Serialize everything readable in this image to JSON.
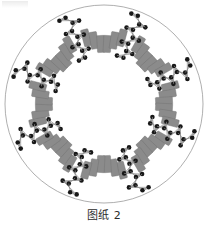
{
  "figure": {
    "caption": "图纸 2",
    "title_text": "图纸 2",
    "type": "radial-winding-diagram",
    "background_color": "#ffffff",
    "outline_color": "#9a9a9a",
    "outline_stroke_width": 0.8,
    "center": {
      "x": 104,
      "y": 104
    },
    "outer_radius": 99,
    "inner_radius": 40,
    "sector_count": 8,
    "sector_start_angle_deg": -90,
    "coil": {
      "label": "coil-bar",
      "fill_color": "#8b8b8b",
      "stroke_color": "#6f6f6f",
      "stroke_width": 0.4,
      "width": 7.5,
      "height": 17,
      "corner_radius": 0.8,
      "count_per_sector": 6,
      "radial_start": 52,
      "radial_step": 9.2,
      "angular_spread_deg": 30
    },
    "connector": {
      "label": "connector-chain",
      "dark_color": "#171717",
      "light_color": "#9d9d9d",
      "dark_radius": 2.3,
      "light_radius": 1.25,
      "link_color": "#8c8c8c",
      "link_width": 0.7,
      "nodes_per_chain": 7,
      "chain_radial_start": 50,
      "chain_radial_step": 7.4,
      "pair_offset_deg": 3.6
    },
    "sectors": [
      {
        "index": 0,
        "name": "sector-n",
        "angle_deg": -90,
        "coils": 6,
        "chains": 2
      },
      {
        "index": 1,
        "name": "sector-ne",
        "angle_deg": -45,
        "coils": 6,
        "chains": 2
      },
      {
        "index": 2,
        "name": "sector-e",
        "angle_deg": 0,
        "coils": 6,
        "chains": 2
      },
      {
        "index": 3,
        "name": "sector-se",
        "angle_deg": 45,
        "coils": 6,
        "chains": 2
      },
      {
        "index": 4,
        "name": "sector-s",
        "angle_deg": 90,
        "coils": 6,
        "chains": 2
      },
      {
        "index": 5,
        "name": "sector-sw",
        "angle_deg": 135,
        "coils": 6,
        "chains": 2
      },
      {
        "index": 6,
        "name": "sector-w",
        "angle_deg": 180,
        "coils": 6,
        "chains": 2
      },
      {
        "index": 7,
        "name": "sector-nw",
        "angle_deg": 225,
        "coils": 6,
        "chains": 2
      }
    ],
    "chain_angles_deg": [
      -67.5,
      -22.5,
      22.5,
      67.5,
      112.5,
      157.5,
      202.5,
      247.5
    ]
  }
}
